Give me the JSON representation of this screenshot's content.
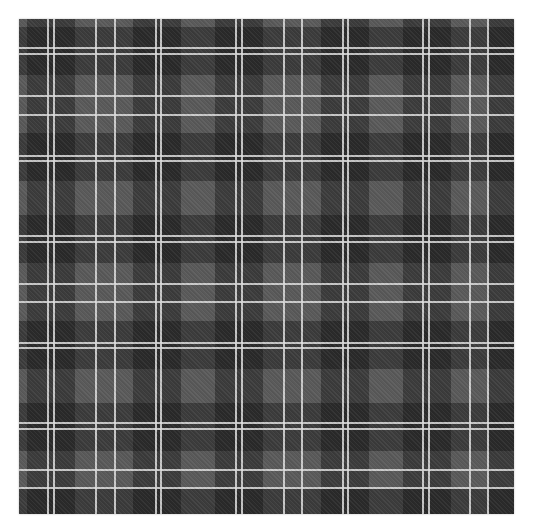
{
  "image": {
    "subject": "grayscale tartan plaid pattern",
    "colors": {
      "page_background": "#ffffff",
      "base": "#5a5a5a",
      "dark_band": "#2a2a2a",
      "line": "#dedede"
    },
    "pattern_box": {
      "x": 19,
      "y": 19,
      "width": 495,
      "height": 495
    },
    "dark_bands": [
      {
        "start": 8,
        "width": 48
      },
      {
        "start": 114,
        "width": 48
      },
      {
        "start": 196,
        "width": 48
      },
      {
        "start": 302,
        "width": 48
      },
      {
        "start": 384,
        "width": 48
      },
      {
        "start": 470,
        "width": 25
      }
    ],
    "lines": [
      28,
      34,
      76,
      95,
      136,
      141,
      216,
      222,
      264,
      282,
      323,
      328,
      403,
      409,
      450,
      468
    ]
  }
}
